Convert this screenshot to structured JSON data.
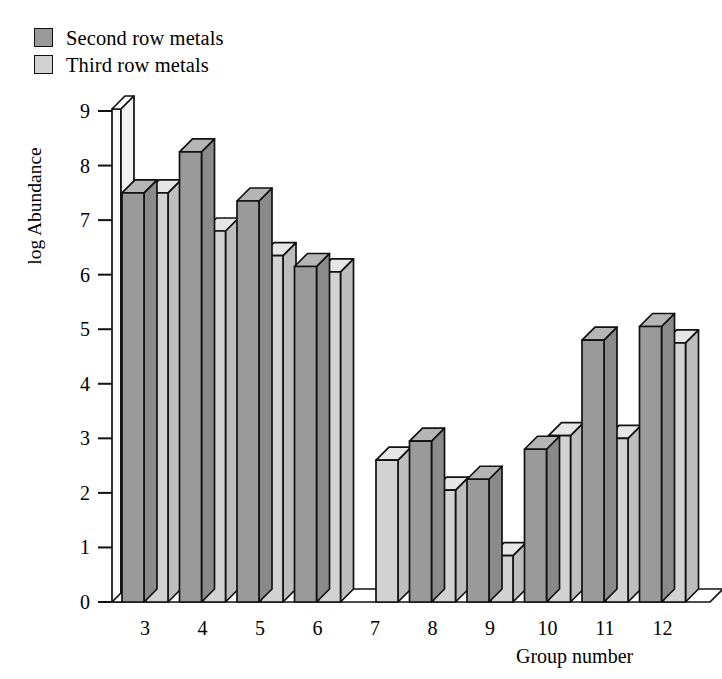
{
  "legend": {
    "position": "top-left",
    "entries": [
      {
        "label": "Second row metals",
        "color": "#9a9a9a",
        "swatch_name": "legend-swatch-second-row"
      },
      {
        "label": "Third row metals",
        "color": "#d2d2d2",
        "swatch_name": "legend-swatch-third-row"
      }
    ]
  },
  "axes": {
    "ylabel": "log Abundance",
    "xlabel": "Group number",
    "yticks": [
      "0",
      "1",
      "2",
      "3",
      "4",
      "5",
      "6",
      "7",
      "8",
      "9"
    ],
    "xticks": [
      "3",
      "4",
      "5",
      "6",
      "7",
      "8",
      "9",
      "10",
      "11",
      "12"
    ],
    "ylim": [
      0,
      9
    ],
    "grid": false
  },
  "chart_data": {
    "type": "bar",
    "title": "",
    "subtitle": "",
    "xlabel": "Group number",
    "ylabel": "log Abundance",
    "ylim": [
      0,
      9
    ],
    "grid": false,
    "legend_position": "top-left",
    "style": "3d-bars",
    "categories": [
      "3",
      "4",
      "5",
      "6",
      "7",
      "8",
      "9",
      "10",
      "11",
      "12"
    ],
    "series": [
      {
        "name": "Second row metals",
        "color": "#9a9a9a",
        "values": [
          7.5,
          8.25,
          7.35,
          6.15,
          null,
          2.95,
          2.25,
          2.8,
          4.8,
          5.05
        ]
      },
      {
        "name": "Third row metals",
        "color": "#d2d2d2",
        "values": [
          7.5,
          6.8,
          6.35,
          6.05,
          2.6,
          2.05,
          0.85,
          3.05,
          3.0,
          4.75
        ]
      }
    ]
  },
  "colors": {
    "bar_dark": "#9a9a9a",
    "bar_dark_side": "#8a8a8a",
    "bar_dark_top": "#b5b5b5",
    "bar_light": "#d2d2d2",
    "bar_light_side": "#bdbdbd",
    "bar_light_top": "#e6e6e6",
    "outline": "#111111",
    "background": "#ffffff",
    "axis_face": "#fbfbfb"
  }
}
